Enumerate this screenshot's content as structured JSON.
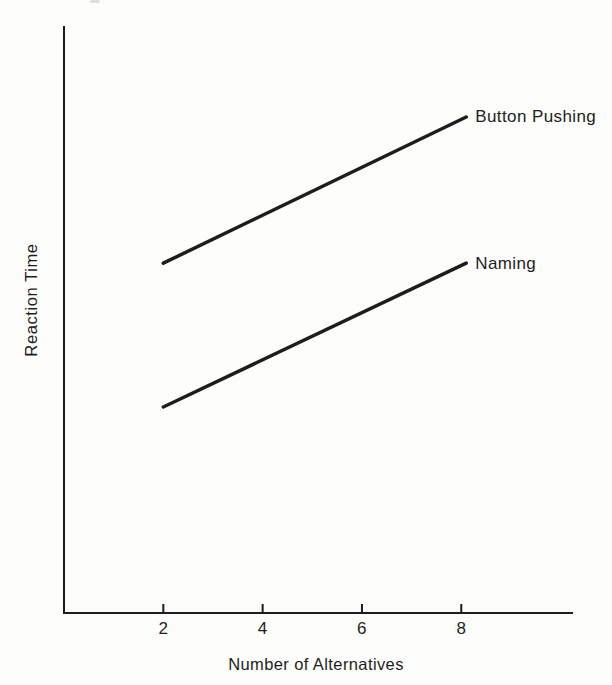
{
  "figure": {
    "background": "#fdfdfb",
    "ink_color": "#1d1d1d"
  },
  "chart_data": {
    "type": "line",
    "title": "",
    "xlabel": "Number of Alternatives",
    "ylabel": "Reaction Time",
    "x_ticks": [
      2,
      4,
      6,
      8
    ],
    "x_range": [
      0,
      10.25
    ],
    "y_range": [
      0,
      1
    ],
    "y_scale": "relative (y-axis shows no numeric tick labels)",
    "grid": false,
    "legend_position": "labels at right end of each line",
    "series": [
      {
        "name": "Button Pushing",
        "x": [
          2,
          8.1
        ],
        "y": [
          0.596,
          0.845
        ]
      },
      {
        "name": "Naming",
        "x": [
          2,
          8.1
        ],
        "y": [
          0.351,
          0.596
        ]
      }
    ]
  }
}
